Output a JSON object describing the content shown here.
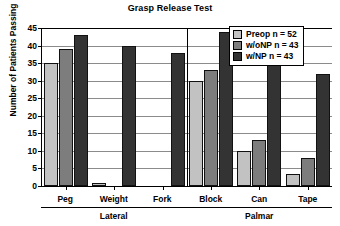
{
  "chart_data": {
    "type": "bar",
    "title": "Grasp Release Test",
    "xlabel": "",
    "ylabel": "Number of Patients Passing",
    "ylim": [
      0,
      45
    ],
    "yticks": [
      0,
      5,
      10,
      15,
      20,
      25,
      30,
      35,
      40,
      45
    ],
    "grid": true,
    "legend_position": "top-right",
    "categories": [
      "Peg",
      "Weight",
      "Fork",
      "Block",
      "Can",
      "Tape"
    ],
    "group_brackets": [
      {
        "label": "Lateral",
        "categories": [
          "Peg",
          "Weight",
          "Fork"
        ]
      },
      {
        "label": "Palmar",
        "categories": [
          "Block",
          "Can",
          "Tape"
        ]
      }
    ],
    "series": [
      {
        "name": "Preop n = 52",
        "color": "#c2c2c2",
        "values": [
          35,
          1,
          null,
          30,
          10,
          3.5
        ]
      },
      {
        "name": "w/oNP n = 43",
        "color": "#7d7d7d",
        "values": [
          39,
          null,
          null,
          33,
          13,
          8
        ]
      },
      {
        "name": "w/NP n = 43",
        "color": "#333333",
        "values": [
          43,
          40,
          38,
          44,
          35,
          32
        ]
      }
    ]
  },
  "legend": {
    "items": [
      {
        "label": "Preop n = 52"
      },
      {
        "label": "w/oNP n = 43"
      },
      {
        "label": "w/NP n = 43"
      }
    ]
  },
  "colors": {
    "series_light": "#c2c2c2",
    "series_medium": "#7d7d7d",
    "series_dark": "#333333",
    "axis": "#000000",
    "gridline": "#8b8b8b",
    "background": "#ffffff"
  }
}
